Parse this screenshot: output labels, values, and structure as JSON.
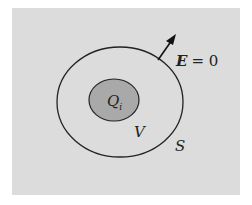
{
  "diagram": {
    "labels": {
      "charge": "Q",
      "charge_sub": "i",
      "volume": "V",
      "surface": "S",
      "field": "E",
      "field_eq": "= 0"
    },
    "colors": {
      "background": "#dcdcdc",
      "inner_fill": "#a9a9a9",
      "stroke": "#222222"
    }
  }
}
